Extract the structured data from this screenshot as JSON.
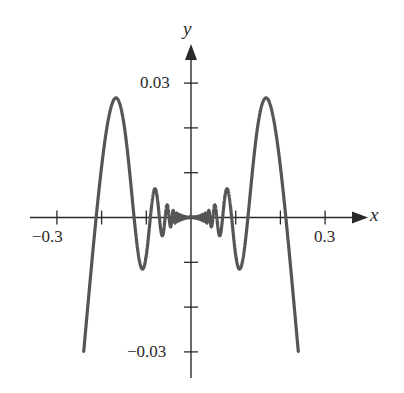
{
  "chart_data": {
    "type": "line",
    "title": "",
    "function": "y = x^2 cos(1/x)",
    "xlabel": "x",
    "ylabel": "y",
    "xlim": [
      -0.3,
      0.3
    ],
    "ylim": [
      -0.03,
      0.03
    ],
    "domain": [
      -0.24,
      0.24
    ],
    "grid": false,
    "legend": null,
    "x_ticks": [
      -0.3,
      -0.2,
      -0.1,
      0.1,
      0.2,
      0.3
    ],
    "x_tick_labels": {
      "-0.3": "−0.3",
      "0.3": "0.3"
    },
    "y_ticks": [
      -0.03,
      -0.02,
      -0.01,
      0.01,
      0.02,
      0.03
    ],
    "y_tick_labels": {
      "-0.03": "−0.03",
      "0.03": "0.03"
    },
    "series": [
      {
        "name": "x^2 cos(1/x)",
        "color": "#555555",
        "x": [
          -0.24,
          -0.21,
          -0.168,
          -0.127,
          -0.106,
          -0.091,
          -0.064,
          0,
          0.064,
          0.091,
          0.106,
          0.127,
          0.168,
          0.21,
          0.24
        ],
        "y": [
          -0.0299,
          0.0,
          0.0267,
          0.0,
          -0.0112,
          0.0,
          0.0041,
          0.0,
          0.0041,
          0.0,
          -0.0112,
          0.0,
          0.0267,
          0.0,
          -0.0299
        ]
      }
    ],
    "annotations": []
  },
  "labels": {
    "x_axis_var": "x",
    "y_axis_var": "y",
    "x_neg": "−0.3",
    "x_pos": "0.3",
    "y_pos": "0.03",
    "y_neg": "−0.03"
  },
  "colors": {
    "axis": "#2a2a2a",
    "curve": "#555555"
  }
}
